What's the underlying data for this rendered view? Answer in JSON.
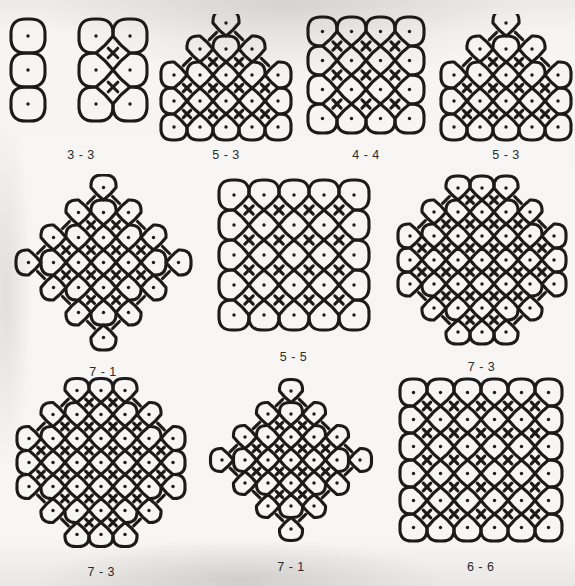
{
  "page": {
    "background_color": "#f2f2f0",
    "ink_color": "#1b1b1b",
    "stroke_width": 3.1,
    "dot_radius": 1.7
  },
  "patterns": [
    {
      "id": "kolam-3-3",
      "label": "3 - 3",
      "name": "two-panel 3x3 kolam",
      "kind": "pair",
      "spacing": 34,
      "viewbox": [
        0,
        0,
        150,
        130
      ],
      "groups": [
        {
          "origin": [
            22,
            22
          ],
          "rows": [
            1,
            1,
            1
          ],
          "style": "vertical-chain"
        },
        {
          "origin": [
            90,
            22
          ],
          "rows": [
            2,
            2,
            2
          ],
          "style": "grid-weave"
        }
      ]
    },
    {
      "id": "kolam-5-3",
      "label": "5 - 3",
      "name": "triangular 5-3 kolam",
      "kind": "triangle",
      "spacing": 26,
      "viewbox": [
        0,
        0,
        140,
        130
      ],
      "rows": [
        1,
        3,
        5,
        5,
        5
      ],
      "row_offsets": [
        0,
        0,
        0,
        0,
        0
      ]
    },
    {
      "id": "kolam-4-4",
      "label": "4 - 4",
      "name": "square 4x4 kolam",
      "kind": "square",
      "spacing": 29,
      "viewbox": [
        0,
        0,
        140,
        130
      ],
      "rows": [
        4,
        4,
        4,
        4
      ]
    },
    {
      "id": "kolam-5-3-b",
      "label": "5 - 3",
      "name": "triangular 5-3 kolam variant",
      "kind": "triangle",
      "spacing": 26,
      "viewbox": [
        0,
        0,
        140,
        130
      ],
      "rows": [
        1,
        3,
        5,
        5,
        5
      ]
    },
    {
      "id": "kolam-7-1",
      "label": "7 - 1",
      "name": "diamond 7-1 kolam",
      "kind": "diamond",
      "spacing": 25,
      "viewbox": [
        0,
        0,
        185,
        185
      ],
      "rows": [
        1,
        3,
        5,
        7,
        5,
        3,
        1
      ]
    },
    {
      "id": "kolam-5-5",
      "label": "5 - 5",
      "name": "rectangular 5x5 banded kolam",
      "kind": "bands",
      "spacing": 30,
      "viewbox": [
        0,
        0,
        170,
        170
      ],
      "rows": [
        5,
        5,
        5,
        5,
        5
      ]
    },
    {
      "id": "kolam-7-3",
      "label": "7 - 3",
      "name": "hexagonal 7-3 kolam",
      "kind": "hexagon",
      "spacing": 24,
      "viewbox": [
        0,
        0,
        180,
        180
      ],
      "rows": [
        3,
        5,
        7,
        7,
        7,
        5,
        3
      ]
    },
    {
      "id": "kolam-7-3-b",
      "label": "7 - 3",
      "name": "hexagonal 7-3 kolam variant",
      "kind": "hexagon",
      "spacing": 24,
      "viewbox": [
        0,
        0,
        180,
        185
      ],
      "rows": [
        3,
        5,
        7,
        7,
        7,
        5,
        3
      ]
    },
    {
      "id": "kolam-7-1-b",
      "label": "7 - 1",
      "name": "diamond 7-1 kolam variant",
      "kind": "diamond",
      "spacing": 23,
      "viewbox": [
        0,
        0,
        170,
        180
      ],
      "rows": [
        1,
        3,
        5,
        7,
        5,
        3,
        1
      ]
    },
    {
      "id": "kolam-6-6",
      "label": "6 - 6",
      "name": "square 6x6 kolam",
      "kind": "square",
      "spacing": 27,
      "viewbox": [
        0,
        0,
        180,
        180
      ],
      "rows": [
        6,
        6,
        6,
        6,
        6,
        6
      ]
    }
  ],
  "layout": {
    "rows": [
      {
        "row_name": "top-row",
        "pattern_ids": [
          "kolam-3-3",
          "kolam-5-3",
          "kolam-4-4",
          "kolam-5-3-b"
        ]
      },
      {
        "row_name": "middle-row",
        "pattern_ids": [
          "kolam-7-1",
          "kolam-5-5",
          "kolam-7-3"
        ]
      },
      {
        "row_name": "bottom-row",
        "pattern_ids": [
          "kolam-7-3-b",
          "kolam-7-1-b",
          "kolam-6-6"
        ]
      }
    ]
  }
}
